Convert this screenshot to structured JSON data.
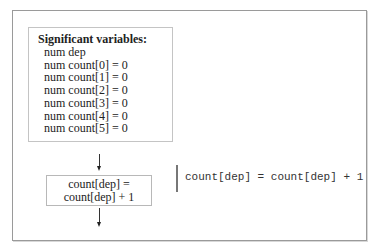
{
  "variables_box": {
    "title": "Significant variables:",
    "lines": [
      "num dep",
      "num count[0] = 0",
      "num count[1] = 0",
      "num count[2] = 0",
      "num count[3] = 0",
      "num count[4] = 0",
      "num count[5] = 0"
    ]
  },
  "statement_box": {
    "line1": "count[dep] =",
    "line2": "count[dep] + 1"
  },
  "code": {
    "text": "count[dep] = count[dep] + 1"
  },
  "colors": {
    "frame_border": "#9a9a9a",
    "box_border": "#c4c4c4",
    "code_bar": "#777777",
    "text": "#222222"
  }
}
